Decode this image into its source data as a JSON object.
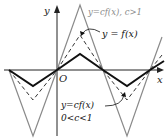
{
  "figure": {
    "axes": {
      "x_label": "x",
      "y_label": "y",
      "origin_label": "O"
    },
    "curves": [
      {
        "name": "f",
        "label": "y = f(x)",
        "style": "solid-black"
      },
      {
        "name": "cf_large",
        "label": "y = cf(x), c > 1",
        "style": "solid-gray"
      },
      {
        "name": "cf_small",
        "label": "y = cf(x)",
        "condition": "0 < c < 1",
        "style": "dashed-black"
      }
    ],
    "labels": {
      "large": "y=cf(x), c>1",
      "f": "y = f(x)",
      "small_eq": "y=cf(x)",
      "small_cond": "0<c<1"
    },
    "colors": {
      "f": "#111111",
      "cf_large": "#8a8a8a",
      "cf_small": "#333333",
      "axis": "#222222",
      "label_gray": "#8a8a8a"
    }
  }
}
